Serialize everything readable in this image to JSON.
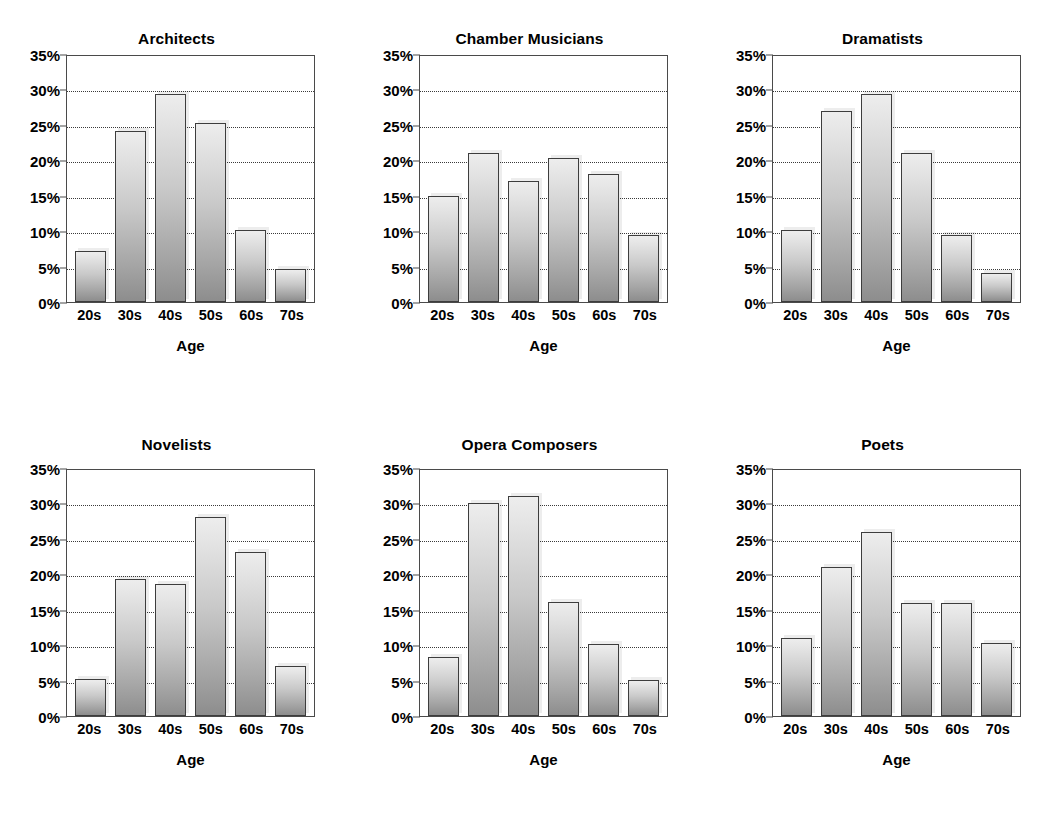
{
  "figure": {
    "axis_title_x": "Age",
    "categories": [
      "20s",
      "30s",
      "40s",
      "50s",
      "60s",
      "70s"
    ],
    "y_tick_labels": [
      "35%",
      "30%",
      "25%",
      "20%",
      "15%",
      "10%",
      "5%",
      "0%"
    ],
    "y_tick_values": [
      35,
      30,
      25,
      20,
      15,
      10,
      5,
      0
    ],
    "colors": {
      "bar_top": "#ededed",
      "bar_bottom": "#8d8d8d",
      "bar_border": "#3d3d3d",
      "gridline": "#3a3a3a",
      "axis": "#4a4a4a",
      "text": "#000000",
      "background": "#ffffff"
    }
  },
  "chart_data": [
    {
      "type": "bar",
      "title": "Architects",
      "xlabel": "Age",
      "ylabel": "",
      "categories": [
        "20s",
        "30s",
        "40s",
        "50s",
        "60s",
        "70s"
      ],
      "values": [
        7.2,
        24.2,
        29.4,
        25.2,
        10.1,
        4.7
      ],
      "ylim": [
        0,
        35
      ],
      "ytick_labels": [
        "0%",
        "5%",
        "10%",
        "15%",
        "20%",
        "25%",
        "30%",
        "35%"
      ],
      "grid": true,
      "legend": "none"
    },
    {
      "type": "bar",
      "title": "Chamber Musicians",
      "xlabel": "Age",
      "ylabel": "",
      "categories": [
        "20s",
        "30s",
        "40s",
        "50s",
        "60s",
        "70s"
      ],
      "values": [
        14.9,
        21.0,
        17.1,
        20.3,
        18.0,
        9.5
      ],
      "ylim": [
        0,
        35
      ],
      "ytick_labels": [
        "0%",
        "5%",
        "10%",
        "15%",
        "20%",
        "25%",
        "30%",
        "35%"
      ],
      "grid": true,
      "legend": "none"
    },
    {
      "type": "bar",
      "title": "Dramatists",
      "xlabel": "Age",
      "ylabel": "",
      "categories": [
        "20s",
        "30s",
        "40s",
        "50s",
        "60s",
        "70s"
      ],
      "values": [
        10.2,
        26.9,
        29.4,
        21.0,
        9.5,
        4.1
      ],
      "ylim": [
        0,
        35
      ],
      "ytick_labels": [
        "0%",
        "5%",
        "10%",
        "15%",
        "20%",
        "25%",
        "30%",
        "35%"
      ],
      "grid": true,
      "legend": "none"
    },
    {
      "type": "bar",
      "title": "Novelists",
      "xlabel": "Age",
      "ylabel": "",
      "categories": [
        "20s",
        "30s",
        "40s",
        "50s",
        "60s",
        "70s"
      ],
      "values": [
        5.2,
        19.3,
        18.6,
        28.1,
        23.2,
        7.0
      ],
      "ylim": [
        0,
        35
      ],
      "ytick_labels": [
        "0%",
        "5%",
        "10%",
        "15%",
        "20%",
        "25%",
        "30%",
        "35%"
      ],
      "grid": true,
      "legend": "none"
    },
    {
      "type": "bar",
      "title": "Opera Composers",
      "xlabel": "Age",
      "ylabel": "",
      "categories": [
        "20s",
        "30s",
        "40s",
        "50s",
        "60s",
        "70s"
      ],
      "values": [
        8.3,
        30.0,
        31.0,
        16.1,
        10.1,
        5.1
      ],
      "ylim": [
        0,
        35
      ],
      "ytick_labels": [
        "0%",
        "5%",
        "10%",
        "15%",
        "20%",
        "25%",
        "30%",
        "35%"
      ],
      "grid": true,
      "legend": "none"
    },
    {
      "type": "bar",
      "title": "Poets",
      "xlabel": "Age",
      "ylabel": "",
      "categories": [
        "20s",
        "30s",
        "40s",
        "50s",
        "60s",
        "70s"
      ],
      "values": [
        11.0,
        21.0,
        26.0,
        16.0,
        16.0,
        10.3
      ],
      "ylim": [
        0,
        35
      ],
      "ytick_labels": [
        "0%",
        "5%",
        "10%",
        "15%",
        "20%",
        "25%",
        "30%",
        "35%"
      ],
      "grid": true,
      "legend": "none"
    }
  ]
}
